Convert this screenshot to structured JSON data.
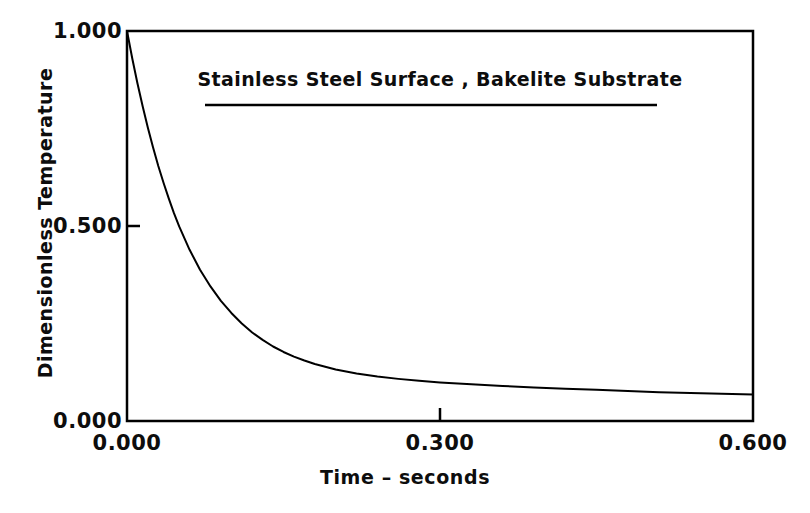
{
  "figure": {
    "background_color": "#ffffff",
    "ink_color": "#000000"
  },
  "chart_data": {
    "type": "line",
    "title": "Stainless Steel Surface , Bakelite Substrate",
    "subtitle": "",
    "xlabel": "Time – seconds",
    "ylabel": "Dimensionless Temperature",
    "xlim": [
      0.0,
      0.6
    ],
    "ylim": [
      0.0,
      1.0
    ],
    "xticks": [
      0.0,
      0.3,
      0.6
    ],
    "xtick_labels": [
      "0.000",
      "0.300",
      "0.600"
    ],
    "yticks": [
      0.0,
      0.5,
      1.0
    ],
    "ytick_labels": [
      "0.000",
      "0.500",
      "1.000"
    ],
    "grid": false,
    "legend": {
      "position": "inside-top-center",
      "entries": [
        {
          "label": "Stainless Steel Surface , Bakelite Substrate",
          "marker": "line",
          "color": "#000000"
        }
      ]
    },
    "series": [
      {
        "name": "Stainless Steel Surface , Bakelite Substrate",
        "color": "#000000",
        "linewidth": 2,
        "x": [
          0.0,
          0.005,
          0.01,
          0.015,
          0.02,
          0.025,
          0.03,
          0.035,
          0.04,
          0.045,
          0.05,
          0.06,
          0.07,
          0.08,
          0.09,
          0.1,
          0.11,
          0.12,
          0.13,
          0.14,
          0.15,
          0.16,
          0.17,
          0.18,
          0.19,
          0.2,
          0.22,
          0.24,
          0.26,
          0.28,
          0.3,
          0.33,
          0.36,
          0.39,
          0.42,
          0.45,
          0.48,
          0.51,
          0.54,
          0.57,
          0.6
        ],
        "y": [
          1.0,
          0.93,
          0.866,
          0.807,
          0.752,
          0.701,
          0.654,
          0.611,
          0.571,
          0.533,
          0.499,
          0.439,
          0.388,
          0.345,
          0.308,
          0.277,
          0.25,
          0.227,
          0.208,
          0.191,
          0.177,
          0.165,
          0.155,
          0.146,
          0.139,
          0.132,
          0.122,
          0.114,
          0.108,
          0.103,
          0.099,
          0.094,
          0.09,
          0.086,
          0.083,
          0.08,
          0.077,
          0.074,
          0.072,
          0.07,
          0.068
        ]
      }
    ],
    "annotations": [
      {
        "type": "legend-rule",
        "description": "horizontal rule under legend text"
      }
    ]
  }
}
